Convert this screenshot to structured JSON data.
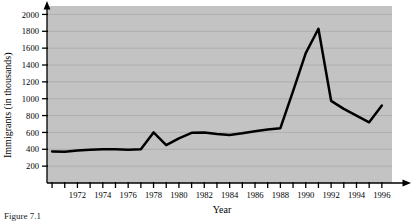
{
  "figure": {
    "caption": "Figure 7.1",
    "plot_background": "#c3c3c3",
    "line_color": "#000000",
    "axis_color": "#000000",
    "grid_color": "#a8a8a8"
  },
  "chart_data": {
    "type": "line",
    "title": "",
    "xlabel": "Year",
    "ylabel": "Immigrants (in thousands)",
    "xlim": [
      1969.6,
      1996.8
    ],
    "ylim": [
      0,
      2100
    ],
    "grid": true,
    "legend": "none",
    "y_ticks": [
      200,
      400,
      600,
      800,
      1000,
      1200,
      1400,
      1600,
      1800,
      2000
    ],
    "x_ticks": [
      1970,
      1971,
      1972,
      1973,
      1974,
      1975,
      1976,
      1977,
      1978,
      1979,
      1980,
      1981,
      1982,
      1983,
      1984,
      1985,
      1986,
      1987,
      1988,
      1989,
      1990,
      1991,
      1992,
      1993,
      1994,
      1995,
      1996
    ],
    "x_tick_labels": [
      "",
      "",
      "1972",
      "",
      "1974",
      "",
      "1976",
      "",
      "1978",
      "",
      "1980",
      "",
      "1982",
      "",
      "1984",
      "",
      "1986",
      "",
      "1988",
      "",
      "1990",
      "",
      "1992",
      "",
      "1994",
      "",
      "1996"
    ],
    "x": [
      1970,
      1971,
      1972,
      1973,
      1974,
      1975,
      1976,
      1977,
      1978,
      1979,
      1980,
      1981,
      1982,
      1983,
      1984,
      1985,
      1986,
      1987,
      1988,
      1989,
      1990,
      1991,
      1992,
      1993,
      1994,
      1995,
      1996
    ],
    "values": [
      375,
      370,
      385,
      395,
      400,
      400,
      395,
      400,
      600,
      450,
      530,
      595,
      600,
      580,
      570,
      590,
      615,
      635,
      650,
      1090,
      1540,
      1830,
      975,
      880,
      800,
      720,
      920
    ],
    "series": [
      {
        "name": "Immigrants",
        "values": [
          375,
          370,
          385,
          395,
          400,
          400,
          395,
          400,
          600,
          450,
          530,
          595,
          600,
          580,
          570,
          590,
          615,
          635,
          650,
          1090,
          1540,
          1830,
          975,
          880,
          800,
          720,
          920
        ]
      }
    ]
  }
}
